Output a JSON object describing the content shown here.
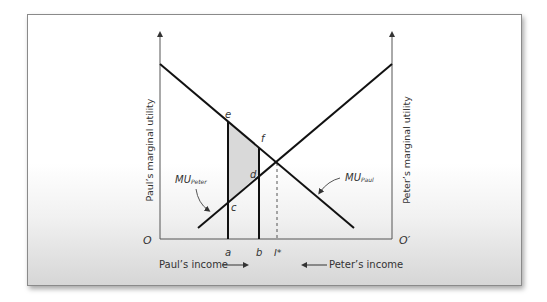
{
  "diagram": {
    "y_axis_left_label": "Paul’s marginal utility",
    "y_axis_right_label": "Peter’s marginal utility",
    "origin_left": "O",
    "origin_right": "O′",
    "x_label_left": "Paul’s income",
    "x_label_right": "Peter’s income",
    "ticks": {
      "a": "a",
      "b": "b",
      "i_star": "I*"
    },
    "points": {
      "e": "e",
      "f": "f",
      "d": "d",
      "c": "c"
    },
    "curves": {
      "mu_paul": {
        "main": "MU",
        "sub": "Paul"
      },
      "mu_peter": {
        "main": "MU",
        "sub": "Peter"
      }
    },
    "colors": {
      "line": "#111111",
      "shade": "#d9d9d9",
      "axis": "#555555",
      "text": "#333333"
    }
  }
}
